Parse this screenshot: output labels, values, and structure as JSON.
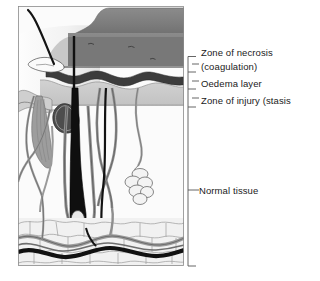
{
  "figure": {
    "labels": {
      "necrosis": "Zone of necrosis",
      "coagulation": "(coagulation)",
      "oedema": "Oedema layer",
      "injury": "Zone of injury (stasis",
      "normal": "Normal tissue"
    },
    "colors": {
      "eschar": "#7e7e7e",
      "eschar_dark": "#6d6d6d",
      "oedema_band": "#3c3c3c",
      "injury_band": "#c9c9c9",
      "epidermis": "#efefef",
      "dermis": "#fbfbfb",
      "fat": "#f0f0f0",
      "vessel_dark": "#111111",
      "vessel_grey": "#8e8e8e",
      "muscle": "#9a9a9a",
      "sebaceous": "#4a4a4a",
      "outline": "#3a3a3a",
      "bracket": "#555555",
      "text": "#1a1a1a",
      "background": "#ffffff"
    },
    "structures": [
      "hair-shaft",
      "eschar-necrotic-slab",
      "oedema-layer-band",
      "zone-of-injury-band",
      "arrector-pili-muscle",
      "sebaceous-gland",
      "hair-follicle",
      "sweat-gland-coil",
      "sweat-duct",
      "dermal-vessels",
      "subcutaneous-fat-lobules",
      "deep-vascular-plexus"
    ],
    "brackets": [
      {
        "name": "necrosis-bracket",
        "top": 56,
        "bottom": 72,
        "tick": 64
      },
      {
        "name": "oedema-bracket",
        "top": 72,
        "bottom": 89,
        "tick": 81
      },
      {
        "name": "injury-bracket",
        "top": 89,
        "bottom": 107,
        "tick": 98
      },
      {
        "name": "normal-bracket",
        "top": 107,
        "bottom": 266,
        "tick": 190
      }
    ]
  }
}
